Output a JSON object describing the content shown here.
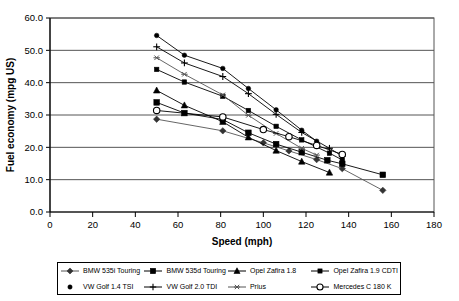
{
  "chart_data": {
    "type": "line",
    "title": "",
    "xlabel": "Speed (mph)",
    "ylabel": "Fuel economy (mpg US)",
    "xlim": [
      0,
      180
    ],
    "ylim": [
      0,
      60
    ],
    "xticks": [
      "0",
      "20",
      "40",
      "60",
      "80",
      "100",
      "120",
      "140",
      "160",
      "180"
    ],
    "yticks": [
      "0.0",
      "10.0",
      "20.0",
      "30.0",
      "40.0",
      "50.0",
      "60.0"
    ],
    "grid": "horizontal",
    "legend_position": "bottom",
    "series": [
      {
        "name": "BMW 535i Touring",
        "marker": "diamond",
        "x": [
          50,
          81,
          100,
          112,
          125,
          137,
          156
        ],
        "y": [
          28.7,
          25.1,
          21.4,
          18.9,
          16.2,
          13.4,
          6.7
        ]
      },
      {
        "name": "BMW 535d Touring",
        "marker": "square",
        "x": [
          50,
          63,
          81,
          93,
          106,
          118,
          130,
          137,
          156
        ],
        "y": [
          33.9,
          30.6,
          28.6,
          24.5,
          21.0,
          18.5,
          16.0,
          14.9,
          11.5
        ]
      },
      {
        "name": "Opel Zafira 1.8",
        "marker": "triangle",
        "x": [
          50,
          63,
          81,
          93,
          106,
          118,
          131
        ],
        "y": [
          37.6,
          33.0,
          27.9,
          23.1,
          19.0,
          15.6,
          12.2
        ]
      },
      {
        "name": "Opel Zafira 1.9 CDTI",
        "marker": "square-small",
        "x": [
          50,
          63,
          81,
          93,
          106,
          118,
          131,
          137
        ],
        "y": [
          44.1,
          40.2,
          35.8,
          31.4,
          26.5,
          22.3,
          18.2,
          16.1
        ]
      },
      {
        "name": "VW Golf 1.4 TSI",
        "marker": "dot",
        "x": [
          50,
          63,
          81,
          93,
          106,
          118,
          125
        ],
        "y": [
          54.6,
          48.5,
          44.4,
          38.2,
          31.6,
          25.3,
          21.9
        ]
      },
      {
        "name": "VW Golf 2.0 TDI",
        "marker": "plus",
        "x": [
          50,
          63,
          81,
          93,
          106,
          118,
          131,
          137
        ],
        "y": [
          51.1,
          46.1,
          41.9,
          36.6,
          30.2,
          24.6,
          19.7,
          17.3
        ]
      },
      {
        "name": "Prius",
        "marker": "star",
        "x": [
          50,
          63,
          81,
          93,
          106,
          118,
          125
        ],
        "y": [
          47.7,
          42.6,
          36.2,
          29.9,
          24.3,
          19.7,
          17.6
        ]
      },
      {
        "name": "Mercedes C 180 K",
        "marker": "circle-open",
        "x": [
          50,
          81,
          100,
          112,
          125,
          137
        ],
        "y": [
          31.4,
          29.4,
          25.5,
          23.3,
          20.6,
          17.8
        ]
      }
    ]
  },
  "legend": {
    "items": [
      {
        "label": "BMW 535i Touring",
        "marker": "diamond"
      },
      {
        "label": "BMW 535d Touring",
        "marker": "square"
      },
      {
        "label": "Opel Zafira 1.8",
        "marker": "triangle"
      },
      {
        "label": "Opel Zafira 1.9 CDTI",
        "marker": "square-small"
      },
      {
        "label": "VW Golf 1.4 TSI",
        "marker": "dot"
      },
      {
        "label": "VW Golf 2.0 TDI",
        "marker": "plus"
      },
      {
        "label": "Prius",
        "marker": "star"
      },
      {
        "label": "Mercedes C 180 K",
        "marker": "circle-open"
      }
    ]
  }
}
